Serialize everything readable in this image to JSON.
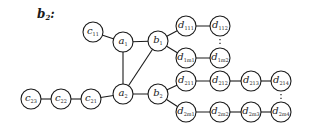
{
  "title": {
    "base": "b",
    "sub": "2",
    "suffix": ":"
  },
  "nodes": [
    {
      "id": "c11",
      "base": "c",
      "sub": "11",
      "x": 93,
      "y": 32
    },
    {
      "id": "a1",
      "base": "a",
      "sub": "1",
      "x": 123,
      "y": 42
    },
    {
      "id": "b1",
      "base": "b",
      "sub": "1",
      "x": 158,
      "y": 41
    },
    {
      "id": "d111",
      "base": "d",
      "sub": "111",
      "x": 186,
      "y": 26
    },
    {
      "id": "d112",
      "base": "d",
      "sub": "112",
      "x": 220,
      "y": 26
    },
    {
      "id": "d1m1",
      "base": "d",
      "sub": "1m1",
      "x": 186,
      "y": 58
    },
    {
      "id": "d1m2",
      "base": "d",
      "sub": "1m2",
      "x": 220,
      "y": 58
    },
    {
      "id": "a2",
      "base": "a",
      "sub": "2",
      "x": 123,
      "y": 94
    },
    {
      "id": "b2",
      "base": "b",
      "sub": "2",
      "x": 158,
      "y": 94
    },
    {
      "id": "d211",
      "base": "d",
      "sub": "211",
      "x": 186,
      "y": 81
    },
    {
      "id": "d212",
      "base": "d",
      "sub": "212",
      "x": 220,
      "y": 81
    },
    {
      "id": "d213",
      "base": "d",
      "sub": "213",
      "x": 251,
      "y": 81
    },
    {
      "id": "d214",
      "base": "d",
      "sub": "214",
      "x": 281,
      "y": 81
    },
    {
      "id": "d2m1",
      "base": "d",
      "sub": "2m1",
      "x": 186,
      "y": 112
    },
    {
      "id": "d2m2",
      "base": "d",
      "sub": "2m2",
      "x": 220,
      "y": 112
    },
    {
      "id": "d2m3",
      "base": "d",
      "sub": "2m3",
      "x": 251,
      "y": 112
    },
    {
      "id": "d2m4",
      "base": "d",
      "sub": "2m4",
      "x": 281,
      "y": 112
    },
    {
      "id": "c21",
      "base": "c",
      "sub": "21",
      "x": 91,
      "y": 99
    },
    {
      "id": "c22",
      "base": "c",
      "sub": "22",
      "x": 61,
      "y": 99
    },
    {
      "id": "c23",
      "base": "c",
      "sub": "23",
      "x": 31,
      "y": 99
    }
  ],
  "edges": [
    [
      "c11",
      "a1"
    ],
    [
      "a1",
      "b1"
    ],
    [
      "a1",
      "a2"
    ],
    [
      "a2",
      "b1"
    ],
    [
      "a2",
      "b2"
    ],
    [
      "b1",
      "d111"
    ],
    [
      "d111",
      "d112"
    ],
    [
      "b1",
      "d1m1"
    ],
    [
      "d1m1",
      "d1m2"
    ],
    [
      "b2",
      "d211"
    ],
    [
      "d211",
      "d212"
    ],
    [
      "d212",
      "d213"
    ],
    [
      "d213",
      "d214"
    ],
    [
      "b2",
      "d2m1"
    ],
    [
      "d2m1",
      "d2m2"
    ],
    [
      "d2m2",
      "d2m3"
    ],
    [
      "d2m3",
      "d2m4"
    ],
    [
      "a2",
      "c21"
    ],
    [
      "c21",
      "c22"
    ],
    [
      "c22",
      "c23"
    ]
  ],
  "dotted": [
    [
      "d112",
      "d1m2"
    ],
    [
      "d214",
      "d2m4"
    ]
  ],
  "node_radius": 10
}
